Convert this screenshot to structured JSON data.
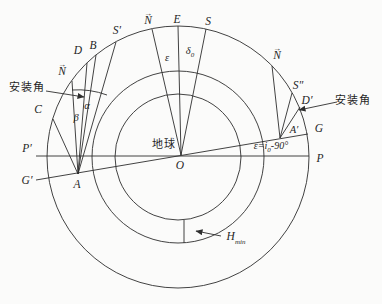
{
  "figure": {
    "type": "geometry-diagram",
    "description_visible_texts": "satellite installation-angle diagram with three concentric circles around Earth",
    "colors": {
      "line": "#2e2e2e",
      "background": "#fbfbfa",
      "text": "#1f1f1f"
    }
  },
  "labels": {
    "install_angle_left": "安装角",
    "install_angle_right": "安装角",
    "earth": "地球",
    "O": "O",
    "A": "A",
    "A_prime": "A′",
    "B": "B",
    "C": "C",
    "D": "D",
    "D_prime": "D′",
    "E": "E",
    "S": "S",
    "S_prime": "S′",
    "S_dprime": "S″",
    "G": "G",
    "G_prime": "G′",
    "P": "P",
    "P_prime": "P′",
    "N": "N",
    "vec_arrow": "→",
    "alpha": "α",
    "beta": "β",
    "epsilon": "ε",
    "delta": "δ",
    "delta_sub": "0",
    "eps_formula_pre": "ε=i",
    "eps_formula_sub": "0",
    "eps_formula_post": "-90°",
    "H": "H",
    "H_sub": "min"
  }
}
